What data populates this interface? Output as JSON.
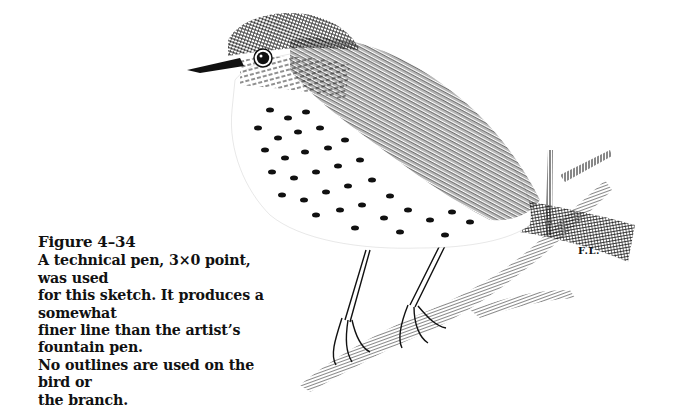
{
  "figure": {
    "label": "Figure 4–34",
    "caption": "A technical pen, 3×0 point, was used for this sketch. It produces a somewhat finer line than the artist’s fountain pen. No outlines are used on the bird or the branch.",
    "caption_lines": [
      "A technical pen, 3×0 point, was used",
      "for this sketch. It produces a somewhat",
      "finer line than the artist’s fountain pen.",
      "No outlines are used on the bird or",
      "the branch."
    ],
    "artist_signature": "F.L.",
    "colors": {
      "ink": "#111111",
      "paper": "#ffffff"
    }
  }
}
